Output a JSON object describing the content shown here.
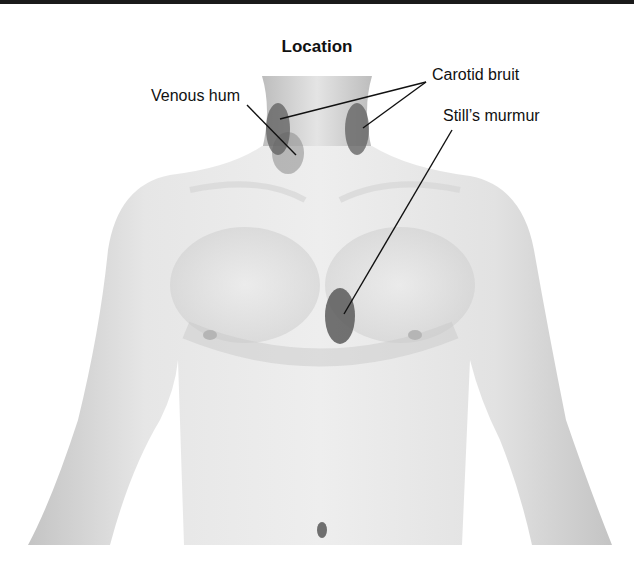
{
  "diagram": {
    "title": "Location",
    "labels": [
      {
        "id": "venous-hum",
        "text": "Venous hum",
        "x": 152,
        "y": 95
      },
      {
        "id": "carotid-bruit",
        "text": "Carotid bruit",
        "x": 432,
        "y": 66
      },
      {
        "id": "stills-murmur",
        "text": "Still’s murmur",
        "x": 443,
        "y": 107
      }
    ],
    "markers": [
      {
        "id": "venous-hum-area",
        "cx": 288,
        "cy": 153,
        "rx": 16,
        "ry": 21,
        "color": "#8a8a8a",
        "opacity": 0.55
      },
      {
        "id": "carotid-right",
        "cx": 278,
        "cy": 129,
        "rx": 12,
        "ry": 26,
        "color": "#5e5e5e",
        "opacity": 0.75
      },
      {
        "id": "carotid-left",
        "cx": 357,
        "cy": 129,
        "rx": 12,
        "ry": 26,
        "color": "#5e5e5e",
        "opacity": 0.75
      },
      {
        "id": "stills-murmur-area",
        "cx": 340,
        "cy": 316,
        "rx": 15,
        "ry": 28,
        "color": "#5a5a5a",
        "opacity": 0.85
      }
    ],
    "leader_lines": [
      {
        "from": [
          247,
          105
        ],
        "to": [
          296,
          155
        ]
      },
      {
        "from": [
          426,
          82
        ],
        "to": [
          280,
          119
        ]
      },
      {
        "from": [
          426,
          82
        ],
        "to": [
          363,
          128
        ]
      },
      {
        "from": [
          452,
          130
        ],
        "to": [
          344,
          314
        ]
      }
    ],
    "colors": {
      "skin_light": "#efefef",
      "skin_mid": "#d4d4d4",
      "skin_shadow": "#b8b8b8",
      "line": "#111111"
    }
  }
}
